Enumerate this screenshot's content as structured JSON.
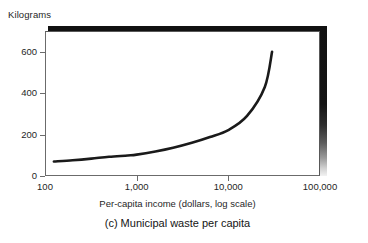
{
  "chart_data": {
    "type": "line",
    "title": "(c) Municipal waste per capita",
    "xlabel": "Per-capita income (dollars, log scale)",
    "ylabel": "Kilograms",
    "xscale": "log",
    "yscale": "linear",
    "xlim": [
      100,
      100000
    ],
    "ylim": [
      0,
      700
    ],
    "grid": false,
    "legend": "none",
    "x_tick_labels": [
      "100",
      "1,000",
      "10,000",
      "100,000"
    ],
    "x_tick_values": [
      100,
      1000,
      10000,
      100000
    ],
    "y_tick_labels": [
      "0",
      "200",
      "400",
      "600"
    ],
    "y_tick_values": [
      0,
      200,
      400,
      600
    ],
    "series": [
      {
        "name": "Municipal waste per capita",
        "x": [
          125,
          200,
          320,
          500,
          800,
          1000,
          1600,
          2500,
          4000,
          6300,
          10000,
          16000,
          25000,
          30000
        ],
        "values": [
          70,
          76,
          84,
          93,
          99,
          103,
          118,
          136,
          160,
          188,
          222,
          290,
          430,
          600
        ]
      }
    ]
  },
  "axes": {
    "y_axis_title": "Kilograms",
    "x_axis_title": "Per-capita income (dollars, log scale)"
  },
  "caption": {
    "text": "(c) Municipal waste per capita"
  },
  "colors": {
    "curve": "#1a1a1a",
    "axis": "#6b6b6b",
    "shadow": "#111111",
    "background": "#ffffff"
  }
}
